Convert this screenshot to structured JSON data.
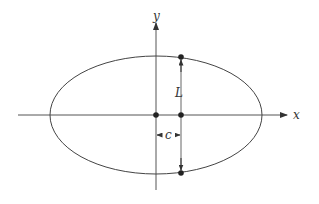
{
  "diagram": {
    "type": "ellipse-focal-chord",
    "labels": {
      "x_axis": "x",
      "y_axis": "y",
      "chord_length": "L",
      "focal_distance": "c"
    },
    "ellipse": {
      "cx": 156,
      "cy": 115,
      "rx": 106,
      "ry": 59
    },
    "focus": {
      "x": 181,
      "y": 115
    },
    "chord_endpoints": [
      {
        "x": 181,
        "y": 57
      },
      {
        "x": 181,
        "y": 173
      }
    ],
    "colors": {
      "stroke": "#333333",
      "point": "#222222",
      "background": "#ffffff"
    }
  }
}
